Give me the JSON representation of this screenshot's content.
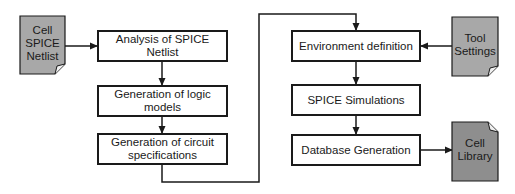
{
  "diagram": {
    "title": "",
    "process_steps": [
      {
        "id": "analysis",
        "label": "Analysis of SPICE Netlist",
        "x": 97,
        "y": 30,
        "w": 131,
        "h": 32
      },
      {
        "id": "logic",
        "label": "Generation of logic models",
        "x": 97,
        "y": 85,
        "w": 131,
        "h": 32
      },
      {
        "id": "specs",
        "label": "Generation of circuit specifications",
        "x": 97,
        "y": 133,
        "w": 131,
        "h": 32
      },
      {
        "id": "env",
        "label": "Environment definition",
        "x": 291,
        "y": 30,
        "w": 130,
        "h": 32
      },
      {
        "id": "sim",
        "label": "SPICE Simulations",
        "x": 291,
        "y": 84,
        "w": 130,
        "h": 32
      },
      {
        "id": "db",
        "label": "Database Generation",
        "x": 291,
        "y": 134,
        "w": 130,
        "h": 32
      }
    ],
    "documents": [
      {
        "id": "netlist",
        "label": "Cell\nSPICE\nNetlist",
        "x": 20,
        "y": 16,
        "w": 45,
        "h": 58,
        "fold": "bottom-right",
        "fill": "#a8a8a8"
      },
      {
        "id": "tool",
        "label": "Tool\nSettings",
        "x": 452,
        "y": 17,
        "w": 46,
        "h": 59,
        "fold": "bottom-right",
        "fill": "#a8a8a8"
      },
      {
        "id": "library",
        "label": "Cell\nLibrary",
        "x": 452,
        "y": 122,
        "w": 46,
        "h": 59,
        "fold": "top-right",
        "fill": "#8e8e8e"
      }
    ],
    "connectors": [
      {
        "from": "netlist",
        "to": "analysis",
        "points": [
          [
            65,
            46
          ],
          [
            97,
            46
          ]
        ]
      },
      {
        "from": "analysis",
        "to": "logic",
        "points": [
          [
            162,
            62
          ],
          [
            162,
            85
          ]
        ]
      },
      {
        "from": "logic",
        "to": "specs",
        "points": [
          [
            162,
            117
          ],
          [
            162,
            133
          ]
        ]
      },
      {
        "from": "specs",
        "to": "env",
        "points": [
          [
            162,
            165
          ],
          [
            162,
            182
          ],
          [
            259,
            182
          ],
          [
            259,
            14
          ],
          [
            356,
            14
          ],
          [
            356,
            30
          ]
        ]
      },
      {
        "from": "env",
        "to": "sim",
        "points": [
          [
            356,
            62
          ],
          [
            356,
            84
          ]
        ]
      },
      {
        "from": "sim",
        "to": "db",
        "points": [
          [
            356,
            116
          ],
          [
            356,
            134
          ]
        ]
      },
      {
        "from": "tool",
        "to": "env",
        "points": [
          [
            452,
            46
          ],
          [
            421,
            46
          ]
        ]
      },
      {
        "from": "db",
        "to": "library",
        "points": [
          [
            421,
            150
          ],
          [
            452,
            150
          ]
        ]
      }
    ],
    "colors": {
      "stroke": "#1a1a1a",
      "box_fill": "#ffffff"
    }
  }
}
